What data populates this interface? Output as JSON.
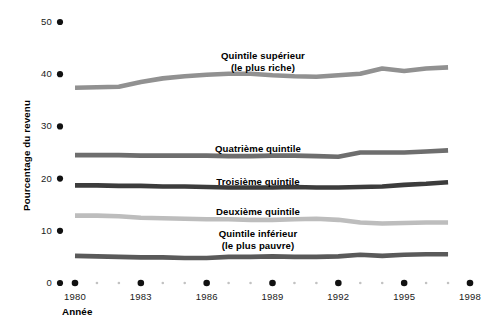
{
  "chart_data": {
    "type": "line",
    "title": "",
    "subtitle": "",
    "xlabel": "Année",
    "ylabel": "Pourcentage du revenu",
    "xlim": [
      1979.2,
      1998.5
    ],
    "ylim": [
      0,
      52
    ],
    "yticks": [
      0,
      10,
      20,
      30,
      40,
      50
    ],
    "ytick_labels": [
      "0",
      "10",
      "20",
      "30",
      "40",
      "50"
    ],
    "xticks": [
      1980,
      1983,
      1986,
      1989,
      1992,
      1995,
      1998
    ],
    "xtick_labels": [
      "1980",
      "1983",
      "1986",
      "1989",
      "1992",
      "1995",
      "1998"
    ],
    "x_minor_ticks": [
      1981,
      1982,
      1984,
      1985,
      1987,
      1988,
      1990,
      1991,
      1993,
      1994,
      1996,
      1997
    ],
    "grid": false,
    "legend": "inline-labels",
    "tick_marker_style": "dot",
    "x": [
      1980,
      1981,
      1982,
      1983,
      1984,
      1985,
      1986,
      1987,
      1988,
      1989,
      1990,
      1991,
      1992,
      1993,
      1994,
      1995,
      1996,
      1997
    ],
    "series": [
      {
        "name": "Quintile supérieur (le plus riche)",
        "label_line1": "Quintile supérieur",
        "label_line2": "(le plus riche)",
        "color": "#919191",
        "values": [
          37.4,
          37.5,
          37.6,
          38.5,
          39.2,
          39.6,
          39.9,
          40.1,
          40.1,
          39.8,
          39.6,
          39.5,
          39.8,
          40.1,
          41.1,
          40.6,
          41.1,
          41.3
        ]
      },
      {
        "name": "Quatrième quintile",
        "label_line1": "Quatrième quintile",
        "label_line2": "",
        "color": "#6e6e6e",
        "values": [
          24.5,
          24.5,
          24.5,
          24.4,
          24.4,
          24.4,
          24.4,
          24.3,
          24.3,
          24.4,
          24.4,
          24.3,
          24.2,
          25.0,
          25.0,
          25.0,
          25.2,
          25.4
        ]
      },
      {
        "name": "Troisième quintile",
        "label_line1": "Troisième quintile",
        "label_line2": "",
        "color": "#3c3c3c",
        "values": [
          18.7,
          18.7,
          18.6,
          18.6,
          18.5,
          18.5,
          18.4,
          18.3,
          18.3,
          18.3,
          18.4,
          18.3,
          18.3,
          18.4,
          18.5,
          18.8,
          19.0,
          19.3
        ]
      },
      {
        "name": "Deuxième quintile",
        "label_line1": "Deuxième quintile",
        "label_line2": "",
        "color": "#bdbdbd",
        "values": [
          12.9,
          12.9,
          12.8,
          12.5,
          12.4,
          12.3,
          12.2,
          12.2,
          12.1,
          12.1,
          12.2,
          12.3,
          12.1,
          11.6,
          11.4,
          11.5,
          11.6,
          11.6
        ]
      },
      {
        "name": "Quintile inférieur (le plus pauvre)",
        "label_line1": "Quintile inférieur",
        "label_line2": "(le plus pauvre)",
        "color": "#5a5a5a",
        "values": [
          5.2,
          5.1,
          5.0,
          4.9,
          4.9,
          4.8,
          4.8,
          5.0,
          5.0,
          5.1,
          5.0,
          5.0,
          5.1,
          5.4,
          5.2,
          5.4,
          5.5,
          5.5
        ]
      }
    ]
  },
  "axes": {
    "y_title": "Pourcentage du revenu",
    "x_title": "Année"
  },
  "colors": {
    "background": "#ffffff",
    "text": "#000000",
    "tick_dot": "#111111",
    "minor_dot": "#c2c2c2"
  }
}
